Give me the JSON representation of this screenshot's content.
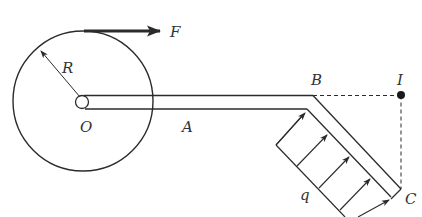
{
  "diagram": {
    "colors": {
      "line": "#2b2b2b",
      "background": "#ffffff",
      "label": "#333333"
    },
    "labels": {
      "force": "F",
      "radius": "R",
      "center": "O",
      "rod_point_a": "A",
      "bend_point": "B",
      "instant_center": "I",
      "end_point": "C",
      "load": "q"
    },
    "elements": [
      {
        "id": "wheel",
        "type": "circle",
        "label": "O",
        "radius_label": "R"
      },
      {
        "id": "force-arrow",
        "type": "arrow",
        "direction": "right",
        "label": "F"
      },
      {
        "id": "rod-OB",
        "type": "double-line-bar",
        "label": "A"
      },
      {
        "id": "rod-BC",
        "type": "double-line-bar",
        "angle_deg": -45
      },
      {
        "id": "distributed-load",
        "type": "uniform-load",
        "label": "q",
        "arrows": 5
      },
      {
        "id": "dashed-BI",
        "type": "dashed-line"
      },
      {
        "id": "dashed-IC",
        "type": "dashed-line"
      },
      {
        "id": "point-I",
        "type": "dot"
      }
    ]
  }
}
